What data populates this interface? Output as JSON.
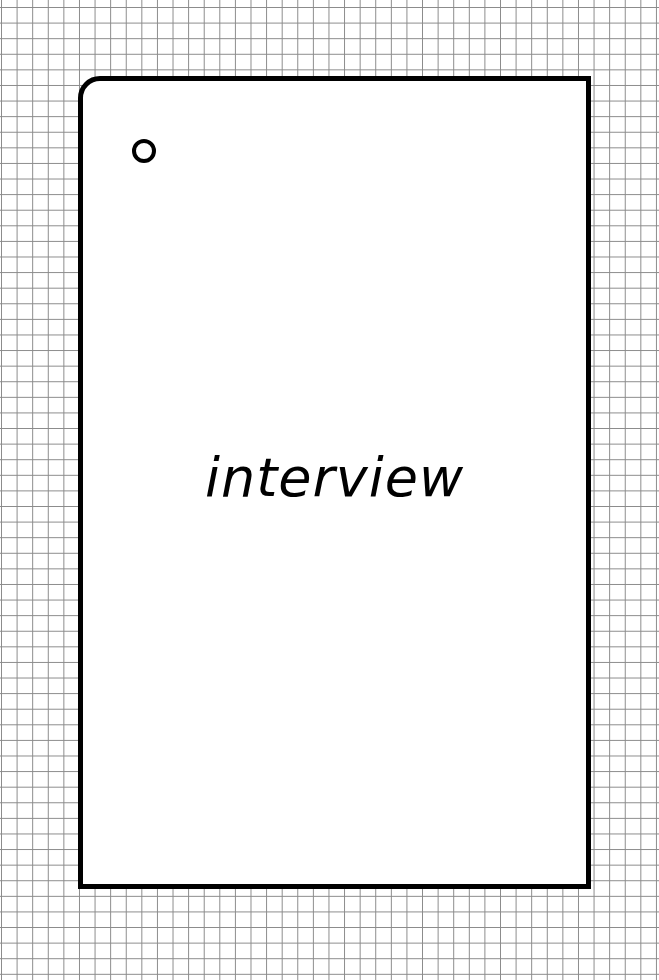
{
  "card": {
    "label": "interview",
    "border_color": "#000000",
    "background_color": "#ffffff"
  },
  "background": {
    "pattern": "grid-paper",
    "grid_color": "#8a8a8a"
  },
  "icons": {
    "hole": "circle-icon"
  }
}
